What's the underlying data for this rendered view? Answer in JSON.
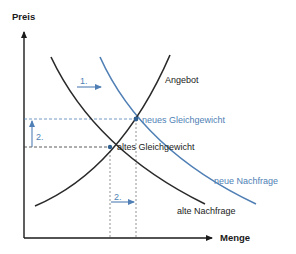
{
  "diagram": {
    "axes": {
      "y_label": "Preis",
      "x_label": "Menge"
    },
    "curves": {
      "supply": "Angebot",
      "old_demand": "alte Nachfrage",
      "new_demand": "neue Nachfrage"
    },
    "points": {
      "old_equilibrium": "altes Gleichgewicht",
      "new_equilibrium": "neues Gleichgewicht"
    },
    "steps": {
      "step1": "1.",
      "step2_price": "2.",
      "step2_quantity": "2."
    },
    "colors": {
      "dark": "#222222",
      "blue": "#4f7fb5"
    }
  }
}
